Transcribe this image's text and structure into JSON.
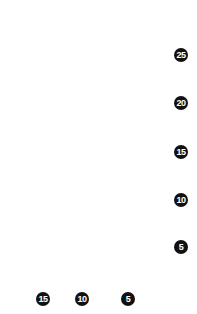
{
  "figure": {
    "kind": "grid-plot",
    "background_color": "#ffffff",
    "cell_color": "#7f7f7f",
    "gridline_color": "#ffffff",
    "badge_background": "#111111",
    "badge_text_color": "#ffffff"
  },
  "chart_data": {
    "type": "heatmap",
    "title": "",
    "subtitle": "",
    "xlabel": "",
    "ylabel": "",
    "grid": true,
    "legend": null,
    "orientation": "vertical",
    "minor_cells_x": 29,
    "minor_cells_y": 50,
    "major_every": 5,
    "x_axis": {
      "position": "bottom",
      "direction": "decreasing-left-to-right",
      "tick_labels": [
        "15",
        "10",
        "5"
      ],
      "tick_values": [
        15,
        10,
        5
      ],
      "tick_x_px": [
        43,
        82,
        128
      ]
    },
    "y_axis": {
      "position": "right",
      "direction": "decreasing-top-to-bottom",
      "tick_labels": [
        "25",
        "20",
        "15",
        "10",
        "5"
      ],
      "tick_values": [
        25,
        20,
        15,
        10,
        5
      ],
      "tick_y_px": [
        55,
        103,
        152,
        200,
        247
      ]
    },
    "values": []
  },
  "y_badges": [
    {
      "label": "25",
      "top": 48
    },
    {
      "label": "20",
      "top": 96
    },
    {
      "label": "15",
      "top": 145
    },
    {
      "label": "10",
      "top": 193
    },
    {
      "label": "5",
      "top": 240
    }
  ],
  "x_badges": [
    {
      "label": "15",
      "left": 36
    },
    {
      "label": "10",
      "left": 75
    },
    {
      "label": "5",
      "left": 121
    }
  ]
}
